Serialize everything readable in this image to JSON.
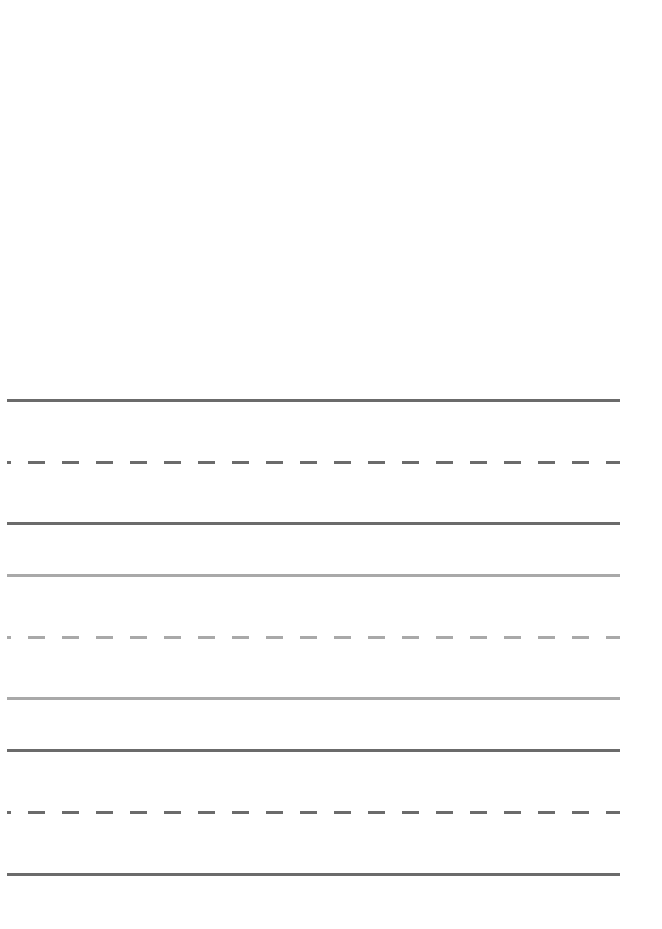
{
  "page": {
    "type": "handwriting-practice-sheet",
    "background": "#ffffff",
    "line_colors": {
      "dark": "#6b6b6b",
      "light": "#a9a9a9"
    },
    "line_groups": [
      {
        "name": "group-1",
        "tone": "dark",
        "lines": [
          {
            "role": "top",
            "style": "solid",
            "y": 399
          },
          {
            "role": "midline",
            "style": "dashed",
            "y": 461
          },
          {
            "role": "baseline",
            "style": "solid",
            "y": 522
          }
        ]
      },
      {
        "name": "group-2",
        "tone": "light",
        "lines": [
          {
            "role": "top",
            "style": "solid",
            "y": 574
          },
          {
            "role": "midline",
            "style": "dashed",
            "y": 636
          },
          {
            "role": "baseline",
            "style": "solid",
            "y": 697
          }
        ]
      },
      {
        "name": "group-3",
        "tone": "dark",
        "lines": [
          {
            "role": "top",
            "style": "solid",
            "y": 749
          },
          {
            "role": "midline",
            "style": "dashed",
            "y": 811
          },
          {
            "role": "baseline",
            "style": "solid",
            "y": 873
          }
        ]
      }
    ]
  }
}
